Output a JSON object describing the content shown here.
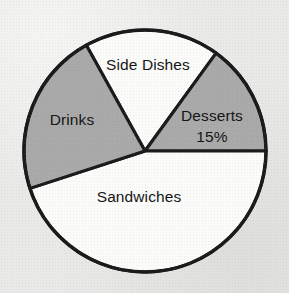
{
  "chart_data": {
    "type": "pie",
    "title": "",
    "subtitle": "",
    "xlabel": "",
    "ylabel": "",
    "legend": "none",
    "grid": false,
    "center": {
      "cx": 145,
      "cy": 151,
      "r": 121
    },
    "start_angle_deg": 331,
    "direction": "clockwise",
    "categories": [
      "Side Dishes",
      "Desserts",
      "Sandwiches",
      "Drinks"
    ],
    "values": [
      18,
      15,
      45,
      22
    ],
    "slices": [
      {
        "label": "Side Dishes",
        "value": 18,
        "value_label": "",
        "start_deg": 331,
        "end_deg": 36,
        "sweep_deg": 65,
        "fill": "#fbfbfa",
        "label_x": 148,
        "label_y": 66
      },
      {
        "label": "Desserts",
        "value": 15,
        "value_label": "15%",
        "start_deg": 36,
        "end_deg": 90,
        "sweep_deg": 54,
        "fill": "#a9a9a9",
        "label_x": 212,
        "label_y": 117,
        "value_x": 212,
        "value_y": 138
      },
      {
        "label": "Sandwiches",
        "value": 45,
        "value_label": "",
        "start_deg": 90,
        "end_deg": 252,
        "sweep_deg": 162,
        "fill": "#fbfbfa",
        "label_x": 139,
        "label_y": 198
      },
      {
        "label": "Drinks",
        "value": 22,
        "value_label": "",
        "start_deg": 252,
        "end_deg": 331,
        "sweep_deg": 79,
        "fill": "#a9a9a9",
        "label_x": 72,
        "label_y": 121
      }
    ],
    "colors": {
      "slice_light": "#fbfbfa",
      "slice_gray": "#a9a9a9",
      "outline": "#1a1a1a",
      "background": "#e9e9e7",
      "text": "#151515"
    }
  }
}
